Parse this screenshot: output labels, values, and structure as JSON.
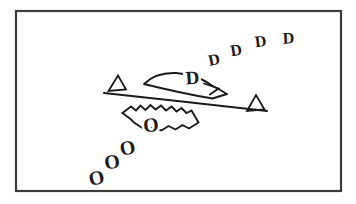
{
  "figure": {
    "background": "#ffffff",
    "frame_color": "#3c3c3c",
    "ink_color": "#1b1b1b",
    "halo_color": "#ffffff",
    "labels": {
      "d_label": "D",
      "o_label": "O"
    },
    "d_trail": [
      "D",
      "D",
      "D",
      "D"
    ],
    "o_trail": [
      "O",
      "O",
      "O"
    ]
  }
}
